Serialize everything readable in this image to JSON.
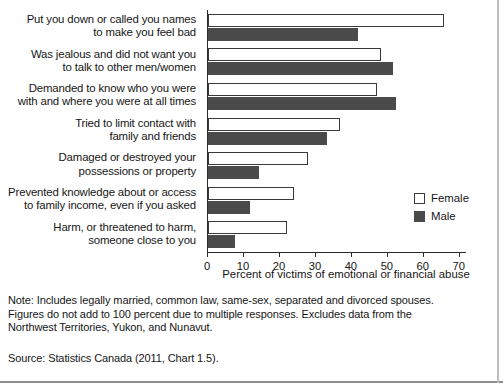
{
  "chart_data": {
    "type": "bar",
    "orientation": "horizontal",
    "title": "",
    "xlabel": "Percent of victims of emotional or financial abuse",
    "ylabel": "",
    "xlim": [
      0,
      72
    ],
    "xticks": [
      0,
      10,
      20,
      30,
      40,
      50,
      60,
      70
    ],
    "grid": false,
    "legend_position": "right-middle",
    "categories": [
      "Put you down or called you names to make you feel bad",
      "Was jealous and did not want you to talk to other men/women",
      "Demanded to know who you were with and where you were at all times",
      "Tried to limit contact with family and friends",
      "Damaged or destroyed your possessions or property",
      "Prevented knowledge about or access to family income, even if you asked",
      "Harm, or threatened to harm, someone close to you"
    ],
    "category_lines": [
      [
        "Put you down or called you names",
        "to make you feel bad"
      ],
      [
        "Was jealous and did not want you",
        "to talk to other men/women"
      ],
      [
        "Demanded to know who you were",
        "with and where you were at all times"
      ],
      [
        "Tried to limit contact with",
        "family and friends"
      ],
      [
        "Damaged or destroyed your",
        "possessions or property"
      ],
      [
        "Prevented knowledge about or access",
        "to family income, even if you asked"
      ],
      [
        "Harm, or threatened to harm,",
        "someone close to you"
      ]
    ],
    "series": [
      {
        "name": "Female",
        "color": "#ffffff",
        "values": [
          65.7,
          48.0,
          47.0,
          36.8,
          27.8,
          24.0,
          21.9
        ]
      },
      {
        "name": "Male",
        "color": "#4a4a4a",
        "values": [
          41.6,
          51.3,
          52.4,
          33.0,
          14.3,
          11.6,
          7.6
        ]
      }
    ]
  },
  "legend": {
    "items": [
      {
        "label": "Female",
        "swatch": "female"
      },
      {
        "label": "Male",
        "swatch": "male"
      }
    ]
  },
  "notes": {
    "lines": [
      "Note: Includes legally married, common law, same-sex, separated and divorced spouses.",
      "Figures do not add to 100 percent due to multiple responses. Excludes data from the",
      "Northwest Territories, Yukon, and Nunavut."
    ],
    "source": "Source: Statistics Canada (2011, Chart 1.5)."
  }
}
